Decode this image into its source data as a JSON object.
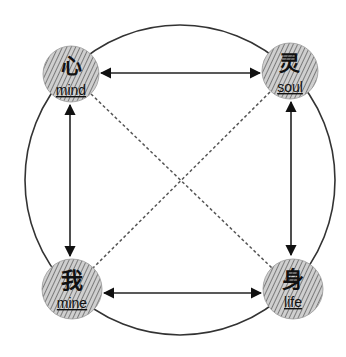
{
  "diagram": {
    "outer_circle": {
      "cx": 180,
      "cy": 180,
      "r": 155
    },
    "colors": {
      "line": "#333333",
      "dashed": "#555555",
      "hatch_bg": "#cfcfcf",
      "hatch_stripe": "#7a7a7a",
      "text": "#111111"
    },
    "nodes": [
      {
        "id": "mind",
        "chinese": "心",
        "english": "mind",
        "cx": 71,
        "cy": 74,
        "r": 28
      },
      {
        "id": "soul",
        "chinese": "灵",
        "english": "soul",
        "cx": 290,
        "cy": 71,
        "r": 28
      },
      {
        "id": "mine",
        "chinese": "我",
        "english": "mine",
        "cx": 72,
        "cy": 289,
        "r": 30
      },
      {
        "id": "life",
        "chinese": "身",
        "english": "life",
        "cx": 293,
        "cy": 289,
        "r": 30
      }
    ],
    "edges": [
      {
        "from": "mind",
        "to": "soul",
        "style": "solid",
        "arrows": "both"
      },
      {
        "from": "mine",
        "to": "life",
        "style": "solid",
        "arrows": "both"
      },
      {
        "from": "mind",
        "to": "mine",
        "style": "solid",
        "arrows": "both"
      },
      {
        "from": "soul",
        "to": "life",
        "style": "solid",
        "arrows": "both"
      },
      {
        "from": "mind",
        "to": "life",
        "style": "dashed",
        "arrows": "none"
      },
      {
        "from": "soul",
        "to": "mine",
        "style": "dashed",
        "arrows": "none"
      }
    ]
  }
}
